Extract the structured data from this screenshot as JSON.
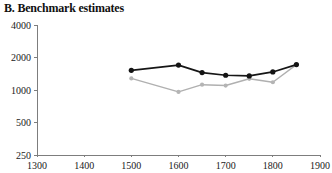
{
  "chart_data": {
    "type": "line",
    "title": "B. Benchmark estimates",
    "xlabel": "",
    "ylabel": "",
    "xlim": [
      1300,
      1900
    ],
    "ylim": [
      250,
      4000
    ],
    "yscale": "log",
    "grid": false,
    "legend": "none",
    "xticks": [
      1300,
      1400,
      1500,
      1600,
      1700,
      1800,
      1900
    ],
    "xticklabels": [
      "1300",
      "1400",
      "1500",
      "1600",
      "1700",
      "1800",
      "1900"
    ],
    "yticks": [
      250,
      500,
      1000,
      2000,
      4000
    ],
    "yticklabels": [
      "250",
      "500",
      "1000",
      "2000",
      "4000"
    ],
    "series": [
      {
        "name": "benchmark-upper",
        "color": "#141414",
        "marker": "circle-filled",
        "x": [
          1500,
          1600,
          1650,
          1700,
          1750,
          1800,
          1850
        ],
        "values": [
          1520,
          1700,
          1450,
          1370,
          1350,
          1470,
          1720
        ]
      },
      {
        "name": "benchmark-lower",
        "color": "#b4b4b4",
        "marker": "circle-filled",
        "x": [
          1500,
          1600,
          1650,
          1700,
          1750,
          1800,
          1850
        ],
        "values": [
          1280,
          960,
          1120,
          1100,
          1270,
          1180,
          1720
        ]
      }
    ]
  }
}
